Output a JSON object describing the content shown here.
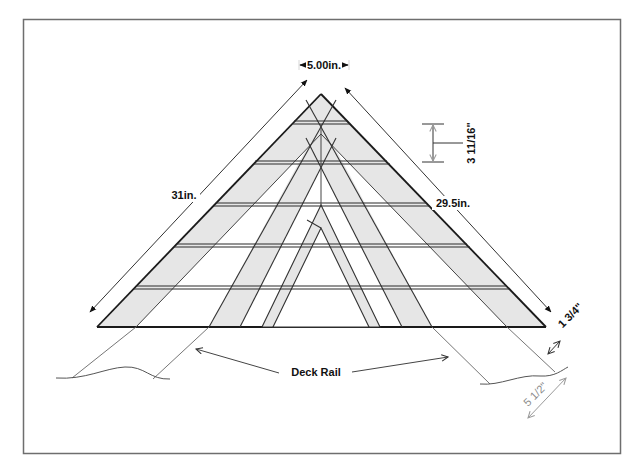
{
  "diagram": {
    "type": "technical-drawing",
    "labels": {
      "top_width": "5.00in.",
      "left_side": "31in.",
      "right_side": "29.5in.",
      "slat_spacing": "3 11/16\"",
      "board_thickness": "1 3/4\"",
      "rail_width": "5 1/2\"",
      "deck_rail": "Deck Rail"
    },
    "colors": {
      "frame_border": "#6e6e6e",
      "line": "#222222",
      "board_fill": "#e6e6e6",
      "thin_line": "#555555",
      "dim_gray": "#9a9a9a",
      "background": "#ffffff"
    },
    "slat_count": 5
  }
}
